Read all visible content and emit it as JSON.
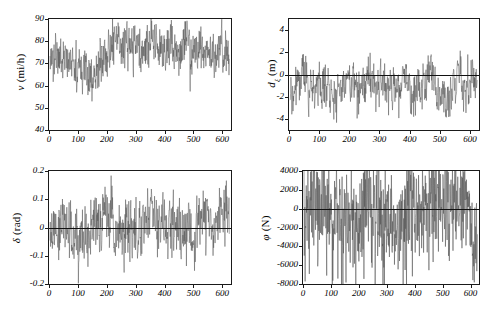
{
  "figure": {
    "background_color": "#ffffff",
    "trace_color": "#555555",
    "axis_color": "#1a1a1a",
    "zero_line_color": "#111111"
  },
  "chart_data": [
    {
      "id": "velocity",
      "type": "line",
      "title": "",
      "position": "top-left",
      "xlabel": "",
      "ylabel": "v (mi/h)",
      "ylabel_symbol": "v",
      "ylabel_unit": "(mi/h)",
      "xlim": [
        0,
        630
      ],
      "ylim": [
        40,
        90
      ],
      "yticks": [
        40,
        50,
        60,
        70,
        80,
        90
      ],
      "ytick_labels": [
        "40",
        "50",
        "60",
        "70",
        "80",
        "90"
      ],
      "xticks": [
        0,
        100,
        200,
        300,
        400,
        500,
        600
      ],
      "xtick_labels": [
        "0",
        "100",
        "200",
        "300",
        "400",
        "500",
        "600"
      ],
      "grid": false,
      "legend": "none",
      "zero_line": false,
      "mean": 72,
      "noise_amplitude": 9,
      "samples": 620,
      "seed": 11,
      "description": "Dense high-frequency vehicle speed trace oscillating mostly between 55 and 88 mi/h with occasional dips near 40 and spikes clipping at 90."
    },
    {
      "id": "lateral-displacement",
      "type": "line",
      "position": "top-right",
      "xlabel": "",
      "ylabel": "d_xi (m)",
      "ylabel_symbol": "d",
      "ylabel_subscript": "ξ",
      "ylabel_unit": "(m)",
      "xlim": [
        0,
        630
      ],
      "ylim": [
        -5,
        5
      ],
      "yticks": [
        -4,
        -2,
        0,
        2,
        4
      ],
      "ytick_labels": [
        "-4",
        "-2",
        "0",
        "2",
        "4"
      ],
      "xticks": [
        0,
        100,
        200,
        300,
        400,
        500,
        600
      ],
      "xtick_labels": [
        "0",
        "100",
        "200",
        "300",
        "400",
        "500",
        "600"
      ],
      "grid": false,
      "legend": "none",
      "zero_line": true,
      "mean": -0.9,
      "noise_amplitude": 1.8,
      "samples": 620,
      "seed": 29,
      "description": "Lateral displacement noise centred slightly below zero, typically spanning -4 to +2.8 m with rare excursions beyond the axis limits."
    },
    {
      "id": "steering-angle",
      "type": "line",
      "position": "bottom-left",
      "xlabel": "",
      "ylabel": "δ (rad)",
      "ylabel_symbol": "δ",
      "ylabel_unit": "(rad)",
      "xlim": [
        0,
        630
      ],
      "ylim": [
        -0.2,
        0.2
      ],
      "yticks": [
        -0.2,
        -0.1,
        0,
        0.1,
        0.2
      ],
      "ytick_labels": [
        "-0.2",
        "-0.1",
        "0",
        "0.1",
        "0.2"
      ],
      "xticks": [
        0,
        100,
        200,
        300,
        400,
        500,
        600
      ],
      "xtick_labels": [
        "0",
        "100",
        "200",
        "300",
        "400",
        "500",
        "600"
      ],
      "grid": false,
      "legend": "none",
      "zero_line": true,
      "mean": 0.0,
      "noise_amplitude": 0.1,
      "samples": 620,
      "seed": 47,
      "description": "Steering angle oscillating symmetrically about zero, commonly reaching ±0.15 rad and clipping at the ±0.2 rad axis bounds."
    },
    {
      "id": "tire-force",
      "type": "line",
      "position": "bottom-right",
      "xlabel": "",
      "ylabel": "φ (N)",
      "ylabel_symbol": "φ",
      "ylabel_unit": "(N)",
      "xlim": [
        0,
        630
      ],
      "ylim": [
        -8000,
        4000
      ],
      "yticks": [
        -8000,
        -6000,
        -4000,
        -2000,
        0,
        2000,
        4000
      ],
      "ytick_labels": [
        "-8000",
        "-6000",
        "-4000",
        "-2000",
        "0",
        "2000",
        "4000"
      ],
      "xticks": [
        0,
        100,
        200,
        300,
        400,
        500,
        600
      ],
      "xtick_labels": [
        "0",
        "100",
        "200",
        "300",
        "400",
        "500",
        "600"
      ],
      "grid": false,
      "legend": "none",
      "zero_line": true,
      "mean": -500,
      "noise_amplitude": 2600,
      "samples": 620,
      "seed": 73,
      "description": "Very dense near-vertical force spikes saturating at the +4000 N top bound and plunging to between -2000 and -6000 N, with several excursions to -8000 N."
    }
  ]
}
